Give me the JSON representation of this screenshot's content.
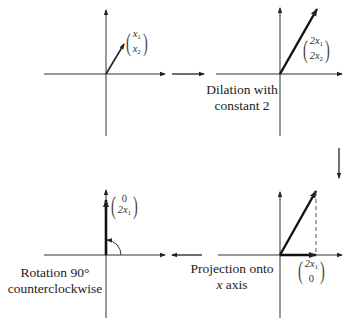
{
  "diagram": {
    "panels": [
      {
        "id": "original",
        "vector_label": {
          "top": "x",
          "top_sub": "1",
          "bottom": "x",
          "bottom_sub": "2"
        },
        "caption": []
      },
      {
        "id": "dilation",
        "vector_label": {
          "top": "2x",
          "top_sub": "1",
          "bottom": "2x",
          "bottom_sub": "2"
        },
        "caption": [
          "Dilation with",
          "constant 2"
        ]
      },
      {
        "id": "projection",
        "vector_label": {
          "top": "2x",
          "top_sub": "1",
          "bottom": "0",
          "bottom_sub": ""
        },
        "caption": [
          "Projection onto",
          "x axis"
        ]
      },
      {
        "id": "rotation",
        "vector_label": {
          "top": "0",
          "top_sub": "",
          "bottom": "2x",
          "bottom_sub": "1"
        },
        "caption": [
          "Rotation 90°",
          "counterclockwise"
        ]
      }
    ],
    "flow_arrows": [
      "right",
      "down",
      "left"
    ],
    "colors": {
      "stroke": "#222222",
      "background": "#ffffff"
    }
  }
}
